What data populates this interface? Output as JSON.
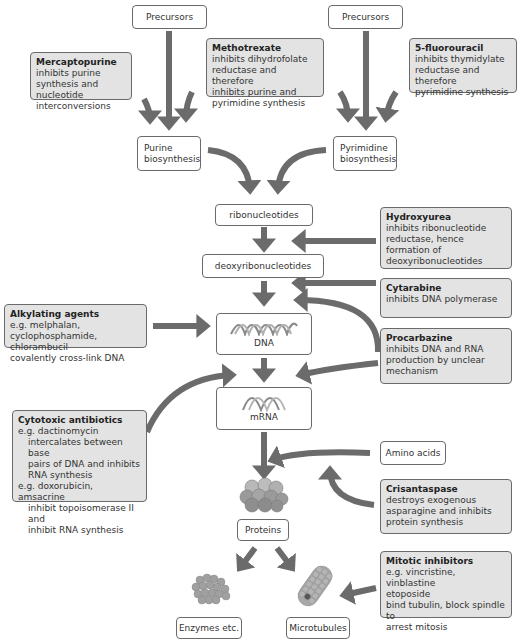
{
  "nodes": {
    "precursors_left": "Precursors",
    "precursors_right": "Precursors",
    "purine_biosynthesis": [
      "Purine",
      "biosynthesis"
    ],
    "pyrimidine_biosynthesis": [
      "Pyrimidine",
      "biosynthesis"
    ],
    "ribonucleotides": "ribonucleotides",
    "deoxyribonucleotides": "deoxyribonucleotides",
    "dna": "DNA",
    "mrna": "mRNA",
    "amino_acids": "Amino acids",
    "proteins": "Proteins",
    "enzymes": "Enzymes etc.",
    "microtubules": "Microtubules"
  },
  "drugs": {
    "mercaptopurine": {
      "name": "Mercaptopurine",
      "lines": [
        "inhibits purine",
        "synthesis and nucleotide",
        "interconversions"
      ]
    },
    "methotrexate": {
      "name": "Methotrexate",
      "lines": [
        "inhibits dihydrofolate",
        "reductase and therefore",
        "inhibits purine and",
        "pyrimidine synthesis"
      ]
    },
    "fluorouracil": {
      "name": "5-fluorouracil",
      "lines": [
        "inhibits thymidylate",
        "reductase and therefore",
        "pyrimidine synthesis"
      ]
    },
    "hydroxyurea": {
      "name": "Hydroxyurea",
      "lines": [
        "inhibits ribonucleotide",
        "reductase, hence formation of",
        "deoxyribonucleotides"
      ]
    },
    "cytarabine": {
      "name": "Cytarabine",
      "lines": [
        "inhibits DNA polymerase"
      ]
    },
    "alkylating": {
      "name": "Alkylating agents",
      "lines": [
        "e.g. melphalan,",
        "cyclophosphamide, chlorambucil",
        "covalently cross-link DNA"
      ]
    },
    "procarbazine": {
      "name": "Procarbazine",
      "lines": [
        "inhibits DNA and RNA",
        "production by unclear",
        "mechanism"
      ]
    },
    "cytotoxic": {
      "name": "Cytotoxic antibiotics",
      "lines": [
        "e.g. dactinomycin",
        "intercalates between base",
        "pairs of DNA and inhibits",
        "RNA synthesis",
        "e.g. doxorubicin, amsacrine",
        "inhibit topoisomerase II and",
        "inhibit RNA synthesis"
      ]
    },
    "crisantaspase": {
      "name": "Crisantaspase",
      "lines": [
        "destroys exogenous",
        "asparagine and inhibits",
        "protein synthesis"
      ]
    },
    "mitotic": {
      "name": "Mitotic inhibitors",
      "lines": [
        "e.g. vincristine, vinblastine",
        "etoposide",
        "bind tubulin, block spindle to",
        "arrest mitosis"
      ]
    }
  },
  "colors": {
    "arrow": "#6b6b6b",
    "drug_box_fill": "#e3e3e3",
    "box_border": "#6a6a6a",
    "protein_sphere": "#9a9a9a"
  },
  "icons": {
    "dna": "dna-double-helix-icon",
    "mrna": "mrna-strand-icon",
    "protein": "protein-cluster-icon",
    "enzyme": "enzyme-cluster-icon",
    "microtubule": "microtubule-icon"
  }
}
